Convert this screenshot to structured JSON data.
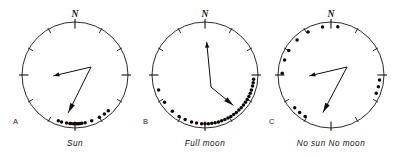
{
  "figure": {
    "background_color": "#ffffff",
    "ink_color": "#16120f",
    "width": 402,
    "height": 158
  },
  "chart_data": {
    "type": "scatter",
    "subtype": "circular-histogram",
    "angle_units": "degrees",
    "angle_convention": "0 = North at top, clockwise",
    "radius_px": 53,
    "tick_interval_deg": 30,
    "tick_count": 12,
    "major_ticks_deg": [
      0,
      90,
      180,
      270
    ],
    "north_label": "N",
    "panels": [
      {
        "id": "A",
        "panel_label": "A",
        "caption": "Sun",
        "center": [
          75,
          75
        ],
        "points_deg": [
          196,
          200,
          186,
          182,
          178,
          174,
          190,
          172,
          168,
          185,
          180,
          176,
          160,
          150,
          143,
          137
        ],
        "vector": {
          "kind": "bent-double-arrow",
          "path_deg": [
            268,
            190
          ],
          "arrowheads": [
            "left",
            "down"
          ]
        }
      },
      {
        "id": "B",
        "panel_label": "B",
        "caption": "Full moon",
        "center": [
          205,
          75
        ],
        "points_deg": [
          95,
          99,
          103,
          108,
          112,
          116,
          120,
          124,
          128,
          132,
          136,
          140,
          144,
          148,
          152,
          156,
          160,
          164,
          168,
          172,
          176,
          180,
          184,
          190,
          196,
          204,
          212,
          222,
          236,
          252
        ],
        "vector": {
          "kind": "bent-double-arrow",
          "path_deg": [
            3,
            137
          ],
          "arrowheads": [
            "up",
            "down-right"
          ]
        }
      },
      {
        "id": "C",
        "panel_label": "C",
        "caption": "No sun  No moon",
        "center": [
          331,
          75
        ],
        "points_deg": [
          8,
          350,
          332,
          316,
          300,
          288,
          272,
          96,
          104,
          112,
          212,
          220,
          228
        ],
        "vector": {
          "kind": "bent-double-arrow",
          "path_deg": [
            268,
            192
          ],
          "arrowheads": [
            "left",
            "down"
          ]
        }
      }
    ],
    "legend": [],
    "grid": false,
    "axis_labels": {
      "x": "",
      "y": ""
    }
  }
}
